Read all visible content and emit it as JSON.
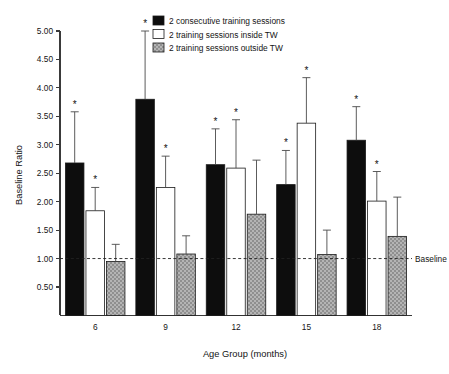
{
  "chart_data": {
    "type": "bar",
    "title": "",
    "xlabel": "Age Group (months)",
    "ylabel": "Baseline Ratio",
    "categories": [
      "6",
      "9",
      "12",
      "15",
      "18"
    ],
    "ylim": [
      0.0,
      5.0
    ],
    "yticks": [
      "0.50",
      "1.00",
      "1.50",
      "2.00",
      "2.50",
      "3.00",
      "3.50",
      "4.00",
      "4.50",
      "5.00"
    ],
    "ytick_values": [
      0.5,
      1.0,
      1.5,
      2.0,
      2.5,
      3.0,
      3.5,
      4.0,
      4.5,
      5.0
    ],
    "grid": false,
    "legend_position": "top-center",
    "reference_line": {
      "label": "Baseline",
      "value": 1.0,
      "style": "dashed"
    },
    "significance_marker": "*",
    "series": [
      {
        "name": "2 consecutive training sessions",
        "fill": "#0d0d0d",
        "pattern": "solid-black",
        "values": [
          2.68,
          3.8,
          2.65,
          2.3,
          3.08
        ],
        "err_upper": [
          3.58,
          5.0,
          3.28,
          2.9,
          3.67
        ],
        "significant": [
          true,
          true,
          true,
          true,
          true
        ]
      },
      {
        "name": "2 training sessions inside TW",
        "fill": "#ffffff",
        "pattern": "open-white",
        "values": [
          1.84,
          2.25,
          2.59,
          3.38,
          2.01
        ],
        "err_upper": [
          2.25,
          2.8,
          3.44,
          4.18,
          2.53
        ],
        "significant": [
          true,
          true,
          true,
          true,
          true
        ]
      },
      {
        "name": "2 training sessions outside TW",
        "fill": "#a8a8a8",
        "pattern": "stippled-gray",
        "values": [
          0.95,
          1.08,
          1.78,
          1.07,
          1.39
        ],
        "err_upper": [
          1.25,
          1.4,
          2.73,
          1.5,
          2.08
        ],
        "significant": [
          false,
          false,
          false,
          false,
          false
        ]
      }
    ]
  },
  "axes": {
    "y_axis_title": "Baseline Ratio",
    "x_axis_title": "Age Group (months)",
    "y_tick_labels": [
      "5.00",
      "4.50",
      "4.00",
      "3.50",
      "3.00",
      "2.50",
      "2.00",
      "1.50",
      "1.00",
      "0.50"
    ],
    "x_tick_labels": [
      "6",
      "9",
      "12",
      "15",
      "18"
    ]
  },
  "legend": {
    "entries": [
      {
        "label": "2 consecutive training sessions",
        "swatch": "#0d0d0d"
      },
      {
        "label": "2 training sessions inside TW",
        "swatch": "#ffffff"
      },
      {
        "label": "2 training sessions outside TW",
        "swatch": "#a8a8a8"
      }
    ]
  },
  "annotations": {
    "baseline_label": "Baseline"
  },
  "colors": {
    "black_bar": "#0d0d0d",
    "white_bar": "#ffffff",
    "gray_bar": "#a8a8a8",
    "axis": "#3a3a3a",
    "text": "#141414"
  }
}
